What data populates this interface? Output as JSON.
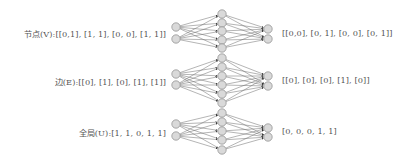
{
  "rows": [
    {
      "name": "nodes",
      "input_label": "节点(V):[[0,1], [1, 1], [0, 0], [1, 1]]",
      "output_label": "[[0,0], [0, 1], [0, 0], [0, 1]]",
      "inputs_y": [
        27,
        39
      ],
      "hidden_y": [
        14,
        23,
        31,
        40,
        48
      ],
      "outputs_y": [
        29,
        39
      ],
      "label_y": 33
    },
    {
      "name": "edges",
      "input_label": "边(E):[[0], [1], [0], [1], [1]]",
      "output_label": "[[0], [0], [0], [1], [0]]",
      "inputs_y": [
        74,
        85
      ],
      "hidden_y": [
        58,
        67,
        76,
        85,
        94,
        103
      ],
      "outputs_y": [
        76,
        86
      ],
      "label_y": 80
    },
    {
      "name": "global",
      "input_label": "全局(U):[1, 1, 0, 1, 1]",
      "output_label": "[0, 0, 0, 1, 1]",
      "inputs_y": [
        124,
        136
      ],
      "hidden_y": [
        113,
        122,
        131,
        140,
        150
      ],
      "outputs_y": [
        128,
        137
      ],
      "label_y": 131
    }
  ],
  "layout": {
    "input_x": 176,
    "hidden_x": 222,
    "output_x": 268,
    "node_radius": 4.2,
    "node_fill": "#d9d9d9",
    "node_stroke": "#8a8a8a",
    "edge_color": "#6a6a6a"
  }
}
